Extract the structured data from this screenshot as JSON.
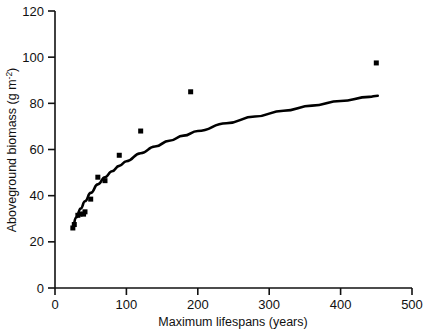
{
  "chart_data": {
    "type": "scatter",
    "title": "",
    "xlabel": "Maximum lifespans (years)",
    "ylabel": "Aboveground biomass (g m-2)",
    "ylabel_parts": {
      "main": "Aboveground biomass (g m",
      "superscript": "-2",
      "tail": ")"
    },
    "xlim": [
      0,
      500
    ],
    "ylim": [
      0,
      120
    ],
    "xticks": [
      0,
      100,
      200,
      300,
      400,
      500
    ],
    "yticks": [
      0,
      20,
      40,
      60,
      80,
      100,
      120
    ],
    "xtick_labels": [
      "0",
      "100",
      "200",
      "300",
      "400",
      "500"
    ],
    "ytick_labels": [
      "0",
      "20",
      "40",
      "60",
      "80",
      "100",
      "120"
    ],
    "grid": false,
    "legend": null,
    "marker": "filled-square",
    "marker_color": "#000000",
    "line_color": "#000000",
    "points": [
      {
        "x": 25,
        "y": 26.0
      },
      {
        "x": 27,
        "y": 27.5
      },
      {
        "x": 32,
        "y": 31.5
      },
      {
        "x": 35,
        "y": 32.0
      },
      {
        "x": 40,
        "y": 32.0
      },
      {
        "x": 42,
        "y": 33.0
      },
      {
        "x": 50,
        "y": 38.5
      },
      {
        "x": 60,
        "y": 48.0
      },
      {
        "x": 70,
        "y": 46.5
      },
      {
        "x": 90,
        "y": 57.5
      },
      {
        "x": 120,
        "y": 68.0
      },
      {
        "x": 190,
        "y": 85.0
      },
      {
        "x": 450,
        "y": 97.5
      }
    ],
    "fit_curve": {
      "description": "saturating logarithmic fit through points",
      "x": [
        24,
        30,
        36,
        42,
        50,
        60,
        70,
        80,
        90,
        100,
        120,
        140,
        160,
        180,
        200,
        240,
        280,
        320,
        360,
        400,
        440,
        452
      ],
      "y": [
        26.0,
        30.6,
        34.4,
        37.6,
        41.2,
        44.9,
        48.0,
        50.6,
        52.9,
        54.9,
        58.4,
        61.3,
        63.8,
        66.0,
        68.0,
        71.4,
        74.3,
        76.8,
        79.0,
        81.0,
        82.8,
        83.3
      ]
    }
  }
}
